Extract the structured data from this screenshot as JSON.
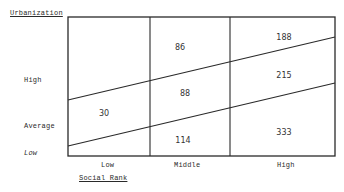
{
  "diagram": {
    "y_axis_title": "Urbanization",
    "x_axis_title": "Social Rank",
    "row_labels": [
      "High",
      "Average",
      "Low"
    ],
    "column_labels": [
      "Low",
      "Middle",
      "High"
    ],
    "cells": [
      {
        "value": "86",
        "column": "Middle",
        "band": "High"
      },
      {
        "value": "188",
        "column": "High",
        "band": "High"
      },
      {
        "value": "88",
        "column": "Middle",
        "band": "Average"
      },
      {
        "value": "215",
        "column": "High",
        "band": "Average"
      },
      {
        "value": "30",
        "column": "Low",
        "band": "Average"
      },
      {
        "value": "114",
        "column": "Middle",
        "band": "Low"
      },
      {
        "value": "333",
        "column": "High",
        "band": "Low"
      }
    ],
    "line_color": "#2a2a2a"
  }
}
